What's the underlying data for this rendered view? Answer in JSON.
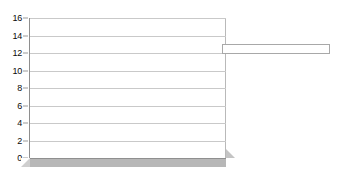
{
  "chart_data": {
    "type": "bar",
    "title": "",
    "xlabel": "",
    "ylabel": "",
    "ylim": [
      0,
      16
    ],
    "ytick_step": 2,
    "yticks": [
      "0",
      "2",
      "4",
      "6",
      "8",
      "10",
      "12",
      "14",
      "16"
    ],
    "grid": true,
    "legend_position": "right",
    "three_d": true,
    "categories": [
      "Amplified telephone",
      "Closed caption TV",
      "Listening device",
      "TDD/TTY",
      "Signaling device",
      "Others"
    ],
    "values": [
      15,
      3.5,
      2.5,
      2.5,
      2.5,
      2.5
    ],
    "colors": [
      "#111111",
      "#4a4a4a",
      "#a3a3a3",
      "#b2b2b2",
      "#d6d6d6",
      "#ffffff"
    ]
  },
  "legend": {
    "items": [
      {
        "label": "Amplified telephone",
        "color": "#111111"
      },
      {
        "label": "Closed caption TV",
        "color": "#4a4a4a"
      },
      {
        "label": "Listening device",
        "color": "#a3a3a3"
      },
      {
        "label": "TDD/TTY",
        "color": "#b2b2b2"
      },
      {
        "label": "Signaling device",
        "color": "#d6d6d6"
      },
      {
        "label": "Others",
        "color": "#ffffff"
      }
    ]
  }
}
